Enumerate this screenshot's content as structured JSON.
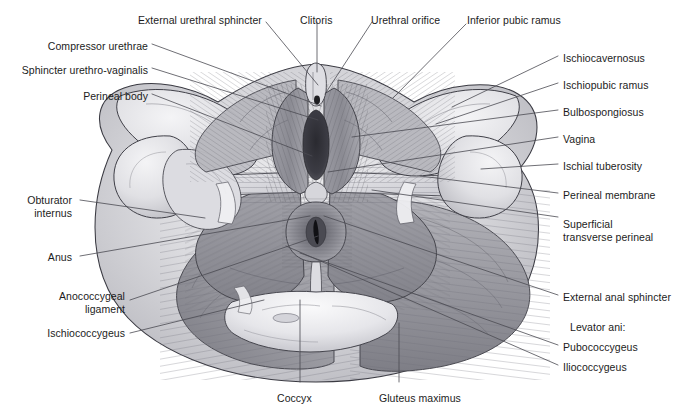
{
  "figure": {
    "background_color": "#ffffff",
    "text_color": "#1c1c1c",
    "leader_color": "#4a4a52",
    "width": 677,
    "height": 417
  },
  "labels": {
    "top": [
      {
        "id": "external-urethral-sphincter",
        "text": "External urethral sphincter",
        "x": 138,
        "y": 14,
        "align": "left"
      },
      {
        "id": "clitoris",
        "text": "Clitoris",
        "x": 300,
        "y": 14,
        "align": "left"
      },
      {
        "id": "urethral-orifice",
        "text": "Urethral orifice",
        "x": 371,
        "y": 14,
        "align": "left"
      },
      {
        "id": "inferior-pubic-ramus",
        "text": "Inferior pubic ramus",
        "x": 467,
        "y": 14,
        "align": "left"
      }
    ],
    "left": [
      {
        "id": "compressor-urethrae",
        "text": "Compressor urethrae",
        "x": 148,
        "y": 40,
        "align": "right"
      },
      {
        "id": "sphincter-urethro-vaginalis",
        "text": "Sphincter urethro-vaginalis",
        "x": 148,
        "y": 64,
        "align": "right"
      },
      {
        "id": "perineal-body",
        "text": "Perineal body",
        "x": 148,
        "y": 90,
        "align": "right"
      },
      {
        "id": "obturator-internus",
        "text": "Obturator\ninternus",
        "x": 72,
        "y": 194,
        "align": "right"
      },
      {
        "id": "anus",
        "text": "Anus",
        "x": 72,
        "y": 251,
        "align": "right"
      },
      {
        "id": "anococcygeal-ligament",
        "text": "Anococcygeal\nligament",
        "x": 125,
        "y": 290,
        "align": "right"
      },
      {
        "id": "ischiococcygeus",
        "text": "Ischiococcygeus",
        "x": 125,
        "y": 327,
        "align": "right"
      }
    ],
    "right": [
      {
        "id": "ischiocavernosus",
        "text": "Ischiocavernosus",
        "x": 563,
        "y": 52,
        "align": "left"
      },
      {
        "id": "ischiopubic-ramus",
        "text": "Ischiopubic ramus",
        "x": 563,
        "y": 79,
        "align": "left"
      },
      {
        "id": "bulbospongiosus",
        "text": "Bulbospongiosus",
        "x": 563,
        "y": 106,
        "align": "left"
      },
      {
        "id": "vagina",
        "text": "Vagina",
        "x": 563,
        "y": 133,
        "align": "left"
      },
      {
        "id": "ischial-tuberosity",
        "text": "Ischial tuberosity",
        "x": 563,
        "y": 160,
        "align": "left"
      },
      {
        "id": "perineal-membrane",
        "text": "Perineal membrane",
        "x": 563,
        "y": 189,
        "align": "left"
      },
      {
        "id": "superficial-transverse-perineal",
        "text": "Superficial\ntransverse perineal",
        "x": 563,
        "y": 218,
        "align": "left"
      },
      {
        "id": "external-anal-sphincter",
        "text": "External anal sphincter",
        "x": 563,
        "y": 291,
        "align": "left"
      },
      {
        "id": "levator-ani",
        "text": "Levator ani:",
        "x": 570,
        "y": 321,
        "align": "left"
      },
      {
        "id": "pubococcygeus",
        "text": "Pubococcygeus",
        "x": 563,
        "y": 341,
        "align": "left"
      },
      {
        "id": "iliococcygeus",
        "text": "Iliococcygeus",
        "x": 563,
        "y": 361,
        "align": "left"
      }
    ],
    "bottom": [
      {
        "id": "coccyx",
        "text": "Coccyx",
        "x": 277,
        "y": 392,
        "align": "left"
      },
      {
        "id": "gluteus-maximus",
        "text": "Gluteus maximus",
        "x": 379,
        "y": 392,
        "align": "left"
      }
    ]
  },
  "leaders": [
    {
      "id": "leader-external-urethral-sphincter",
      "d": "M 266 22 L 318 85"
    },
    {
      "id": "leader-clitoris",
      "d": "M 317 22 L 317 72"
    },
    {
      "id": "leader-urethral-orifice",
      "d": "M 372 22 L 325 94"
    },
    {
      "id": "leader-inferior-pubic-ramus",
      "d": "M 466 24 L 393 98"
    },
    {
      "id": "leader-compressor-urethrae",
      "d": "M 152 44 L 321 106"
    },
    {
      "id": "leader-sphincter-urethro-vaginalis",
      "d": "M 152 68 L 318 120"
    },
    {
      "id": "leader-perineal-body",
      "d": "M 152 94 L 312 156"
    },
    {
      "id": "leader-obturator-internus",
      "d": "M 80 200 L 205 218"
    },
    {
      "id": "leader-anus",
      "d": "M 80 256 L 310 216"
    },
    {
      "id": "leader-anococcygeal-ligament",
      "d": "M 130 300 L 318 236"
    },
    {
      "id": "leader-ischiococcygeus",
      "d": "M 130 333 L 264 300"
    },
    {
      "id": "leader-ischiocavernosus",
      "d": "M 558 56 L 452 107"
    },
    {
      "id": "leader-ischiopubic-ramus",
      "d": "M 558 83 L 436 124"
    },
    {
      "id": "leader-bulbospongiosus",
      "d": "M 558 110 L 352 137"
    },
    {
      "id": "leader-vagina",
      "d": "M 558 137 L 328 172"
    },
    {
      "id": "leader-ischial-tuberosity",
      "d": "M 558 164 L 481 169"
    },
    {
      "id": "leader-perineal-membrane",
      "d": "M 558 193 L 420 176"
    },
    {
      "id": "leader-superficial-transverse-perineal",
      "d": "M 558 217 L 372 190"
    },
    {
      "id": "leader-external-anal-sphincter",
      "d": "M 558 295 L 324 216"
    },
    {
      "id": "leader-pubococcygeus",
      "d": "M 558 345 L 300 253"
    },
    {
      "id": "leader-iliococcygeus",
      "d": "M 558 365 L 286 246"
    },
    {
      "id": "leader-coccyx",
      "d": "M 300 382 L 300 300"
    },
    {
      "id": "leader-gluteus-maximus",
      "d": "M 399 382 L 399 323"
    }
  ],
  "illustration": {
    "description": "Shaded greyscale anatomical drawing of the female perineum viewed from below, showing pelvic floor muscles, perineal membrane, vaginal and urethral openings, anus, coccyx and gluteus maximus.",
    "palette": {
      "outline": "#3a3a42",
      "bone_light": "#e8e8ea",
      "bone_mid": "#d2d2d6",
      "muscle_light": "#c6c6ca",
      "muscle_mid": "#a9a9af",
      "muscle_dark": "#8d8d95",
      "muscle_deep": "#76767e",
      "orifice_dark": "#3c3c42",
      "orifice_black": "#1e1e22",
      "membrane": "#dcdce0",
      "highlight": "#f2f2f4"
    }
  }
}
